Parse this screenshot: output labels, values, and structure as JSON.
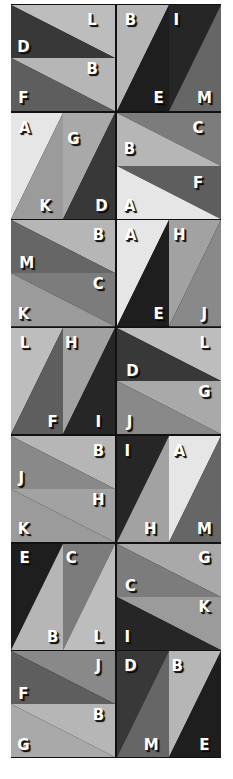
{
  "puzzle": {
    "colors": {
      "A": "#e6e6e6",
      "B": "#b6b6b6",
      "C": "#7c7c7c",
      "D": "#383838",
      "E": "#1e1e1e",
      "F": "#5e5e5e",
      "G": "#a9a9a9",
      "H": "#a2a2a2",
      "I": "#262626",
      "J": "#898989",
      "K": "#9b9b9b",
      "L": "#bdbdbd",
      "M": "#666666"
    },
    "tiles": [
      {
        "row": 0,
        "col": 0,
        "type": "h",
        "pieces": [
          {
            "letter": "L",
            "poly": "0,0 100,0 100,50",
            "lx": 78,
            "ly": 14
          },
          {
            "letter": "D",
            "poly": "0,0 0,50 100,50",
            "lx": 12,
            "ly": 40
          },
          {
            "letter": "B",
            "poly": "0,50 100,50 100,100",
            "lx": 78,
            "ly": 60
          },
          {
            "letter": "F",
            "poly": "0,50 0,100 100,100",
            "lx": 12,
            "ly": 88
          }
        ]
      },
      {
        "row": 0,
        "col": 1,
        "type": "v",
        "pieces": [
          {
            "letter": "B",
            "poly": "0,0 50,0 0,100",
            "lx": 13,
            "ly": 14
          },
          {
            "letter": "I",
            "poly": "50,0 100,0 50,100",
            "lx": 57,
            "ly": 14
          },
          {
            "letter": "E",
            "poly": "50,0 50,100 0,100",
            "lx": 40,
            "ly": 88
          },
          {
            "letter": "M",
            "poly": "100,0 100,100 50,100",
            "lx": 84,
            "ly": 88
          }
        ]
      },
      {
        "row": 1,
        "col": 0,
        "type": "v",
        "pieces": [
          {
            "letter": "A",
            "poly": "0,0 50,0 0,100",
            "lx": 13,
            "ly": 14
          },
          {
            "letter": "G",
            "poly": "50,0 100,0 50,100",
            "lx": 60,
            "ly": 25
          },
          {
            "letter": "K",
            "poly": "50,0 50,100 0,100",
            "lx": 33,
            "ly": 88
          },
          {
            "letter": "D",
            "poly": "100,0 100,100 50,100",
            "lx": 87,
            "ly": 88
          }
        ]
      },
      {
        "row": 1,
        "col": 1,
        "type": "h",
        "pieces": [
          {
            "letter": "C",
            "poly": "0,0 100,0 100,50",
            "lx": 78,
            "ly": 14
          },
          {
            "letter": "B",
            "poly": "0,0 0,50 100,50",
            "lx": 12,
            "ly": 34
          },
          {
            "letter": "F",
            "poly": "0,50 100,50 100,100",
            "lx": 78,
            "ly": 66
          },
          {
            "letter": "A",
            "poly": "0,50 0,100 100,100",
            "lx": 12,
            "ly": 88
          }
        ]
      },
      {
        "row": 2,
        "col": 0,
        "type": "h",
        "pieces": [
          {
            "letter": "B",
            "poly": "0,0 100,0 100,50",
            "lx": 84,
            "ly": 14
          },
          {
            "letter": "M",
            "poly": "0,0 0,50 100,50",
            "lx": 15,
            "ly": 40
          },
          {
            "letter": "C",
            "poly": "0,50 100,50 100,100",
            "lx": 84,
            "ly": 60
          },
          {
            "letter": "K",
            "poly": "0,50 0,100 100,100",
            "lx": 12,
            "ly": 88
          }
        ]
      },
      {
        "row": 2,
        "col": 1,
        "type": "v",
        "pieces": [
          {
            "letter": "A",
            "poly": "0,0 50,0 0,100",
            "lx": 13,
            "ly": 14
          },
          {
            "letter": "H",
            "poly": "50,0 100,0 50,100",
            "lx": 60,
            "ly": 14
          },
          {
            "letter": "E",
            "poly": "50,0 50,100 0,100",
            "lx": 40,
            "ly": 88
          },
          {
            "letter": "J",
            "poly": "100,0 100,100 50,100",
            "lx": 84,
            "ly": 88
          }
        ]
      },
      {
        "row": 3,
        "col": 0,
        "type": "v",
        "pieces": [
          {
            "letter": "L",
            "poly": "0,0 50,0 0,100",
            "lx": 13,
            "ly": 14
          },
          {
            "letter": "H",
            "poly": "50,0 100,0 50,100",
            "lx": 58,
            "ly": 14
          },
          {
            "letter": "F",
            "poly": "50,0 50,100 0,100",
            "lx": 40,
            "ly": 88
          },
          {
            "letter": "I",
            "poly": "100,0 100,100 50,100",
            "lx": 84,
            "ly": 88
          }
        ]
      },
      {
        "row": 3,
        "col": 1,
        "type": "h",
        "pieces": [
          {
            "letter": "L",
            "poly": "0,0 100,0 100,50",
            "lx": 84,
            "ly": 14
          },
          {
            "letter": "D",
            "poly": "0,0 0,50 100,50",
            "lx": 15,
            "ly": 40
          },
          {
            "letter": "G",
            "poly": "0,50 100,50 100,100",
            "lx": 84,
            "ly": 60
          },
          {
            "letter": "J",
            "poly": "0,50 0,100 100,100",
            "lx": 12,
            "ly": 88
          }
        ]
      },
      {
        "row": 4,
        "col": 0,
        "type": "h",
        "pieces": [
          {
            "letter": "B",
            "poly": "0,0 100,0 100,50",
            "lx": 84,
            "ly": 14
          },
          {
            "letter": "J",
            "poly": "0,0 0,50 100,50",
            "lx": 10,
            "ly": 40
          },
          {
            "letter": "H",
            "poly": "0,50 100,50 100,100",
            "lx": 84,
            "ly": 60
          },
          {
            "letter": "K",
            "poly": "0,50 0,100 100,100",
            "lx": 12,
            "ly": 88
          }
        ]
      },
      {
        "row": 4,
        "col": 1,
        "type": "v",
        "pieces": [
          {
            "letter": "I",
            "poly": "0,0 50,0 0,100",
            "lx": 10,
            "ly": 14
          },
          {
            "letter": "A",
            "poly": "50,0 100,0 50,100",
            "lx": 60,
            "ly": 14
          },
          {
            "letter": "H",
            "poly": "50,0 50,100 0,100",
            "lx": 32,
            "ly": 88
          },
          {
            "letter": "M",
            "poly": "100,0 100,100 50,100",
            "lx": 84,
            "ly": 88
          }
        ]
      },
      {
        "row": 5,
        "col": 0,
        "type": "v",
        "pieces": [
          {
            "letter": "E",
            "poly": "0,0 50,0 0,100",
            "lx": 13,
            "ly": 14
          },
          {
            "letter": "C",
            "poly": "50,0 100,0 50,100",
            "lx": 58,
            "ly": 14
          },
          {
            "letter": "B",
            "poly": "50,0 50,100 0,100",
            "lx": 40,
            "ly": 88
          },
          {
            "letter": "L",
            "poly": "100,0 100,100 50,100",
            "lx": 84,
            "ly": 88
          }
        ]
      },
      {
        "row": 5,
        "col": 1,
        "type": "h",
        "pieces": [
          {
            "letter": "G",
            "poly": "0,0 100,0 100,50",
            "lx": 84,
            "ly": 14
          },
          {
            "letter": "C",
            "poly": "0,0 0,50 100,50",
            "lx": 13,
            "ly": 40
          },
          {
            "letter": "K",
            "poly": "0,50 100,50 100,100",
            "lx": 84,
            "ly": 60
          },
          {
            "letter": "I",
            "poly": "0,50 0,100 100,100",
            "lx": 10,
            "ly": 88
          }
        ]
      },
      {
        "row": 6,
        "col": 0,
        "type": "h",
        "pieces": [
          {
            "letter": "J",
            "poly": "0,0 100,0 100,50",
            "lx": 84,
            "ly": 14
          },
          {
            "letter": "F",
            "poly": "0,0 0,50 100,50",
            "lx": 12,
            "ly": 40
          },
          {
            "letter": "B",
            "poly": "0,50 100,50 100,100",
            "lx": 84,
            "ly": 60
          },
          {
            "letter": "G",
            "poly": "0,50 0,100 100,100",
            "lx": 12,
            "ly": 88
          }
        ]
      },
      {
        "row": 6,
        "col": 1,
        "type": "v",
        "pieces": [
          {
            "letter": "D",
            "poly": "0,0 50,0 0,100",
            "lx": 13,
            "ly": 14
          },
          {
            "letter": "B",
            "poly": "50,0 100,0 50,100",
            "lx": 58,
            "ly": 14
          },
          {
            "letter": "M",
            "poly": "50,0 50,100 0,100",
            "lx": 33,
            "ly": 88
          },
          {
            "letter": "E",
            "poly": "100,0 100,100 50,100",
            "lx": 84,
            "ly": 88
          }
        ]
      }
    ]
  }
}
